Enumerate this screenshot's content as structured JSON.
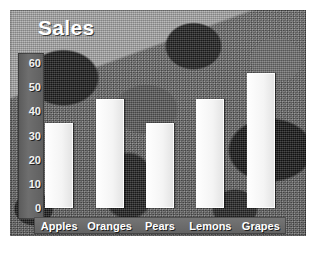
{
  "chart_data": {
    "type": "bar",
    "title": "Sales",
    "xlabel": "",
    "ylabel": "",
    "categories": [
      "Apples",
      "Oranges",
      "Pears",
      "Lemons",
      "Grapes"
    ],
    "values": [
      35,
      45,
      35,
      45,
      56
    ],
    "ylim": [
      0,
      60
    ],
    "yticks": [
      0,
      10,
      20,
      30,
      40,
      50,
      60
    ],
    "ytick_labels": [
      "0",
      "10",
      "20",
      "30",
      "40",
      "50",
      "60"
    ],
    "grid": false,
    "legend": false,
    "legend_position": "none",
    "series": [
      {
        "name": "Sales",
        "values": [
          35,
          45,
          35,
          45,
          56
        ]
      }
    ],
    "style": {
      "bar_color": "#f4f4f4",
      "title_color": "#ffffff",
      "tick_label_color": "#f2f2f2",
      "category_label_color": "#ffffff",
      "axis_strip_color": "#646464",
      "category_band_color": "#6b6b6b",
      "background": "#6b6b6b",
      "background_description": "dithered grayscale leaf photo texture"
    }
  }
}
